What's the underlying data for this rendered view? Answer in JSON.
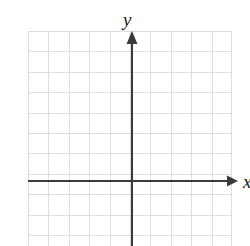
{
  "figure": {
    "kind": "cartesian-coordinate-plane",
    "width": 250,
    "height": 246,
    "background_color": "#ffffff",
    "title": ""
  },
  "labels": {
    "x_axis": "x",
    "y_axis": "y"
  },
  "chart_data": {
    "type": "scatter",
    "title": "",
    "xlabel": "x",
    "ylabel": "y",
    "x": [],
    "y": [],
    "series": [],
    "annotations": [],
    "legend": null,
    "grid": true,
    "xlim": [
      -5,
      5
    ],
    "ylim": [
      -3,
      7
    ],
    "xticks": [],
    "yticks": [],
    "tick_labels_shown": false
  },
  "style": {
    "grid_color": "#dedede",
    "grid_line_width": 1,
    "axis_color": "#3a3a3a",
    "axis_line_width": 2,
    "label_color": "#1c1c1c"
  },
  "geometry": {
    "grid_left": 28,
    "grid_top": 31,
    "grid_right": 232,
    "grid_bottom": 246,
    "cell_size": 20.4,
    "columns": 10,
    "rows": 10,
    "origin_x": 132,
    "origin_y": 181,
    "y_axis_top": 34,
    "x_axis_right": 230,
    "x_axis_left": 28,
    "y_axis_bottom": 246
  }
}
